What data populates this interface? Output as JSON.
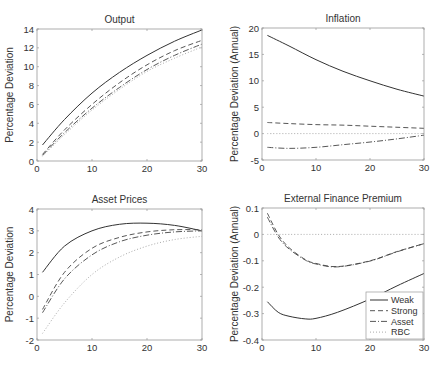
{
  "chart_data": [
    {
      "type": "line",
      "title": "Output",
      "xlabel": "",
      "ylabel": "Percentage Deviation",
      "xlim": [
        0,
        30
      ],
      "ylim": [
        0,
        14
      ],
      "xticks": [
        0,
        10,
        20,
        30
      ],
      "yticks": [
        0,
        2,
        4,
        6,
        8,
        10,
        12,
        14
      ],
      "grid": false,
      "x": [
        1,
        5,
        10,
        15,
        20,
        25,
        30
      ],
      "series": [
        {
          "name": "Weak",
          "style": "solid",
          "values": [
            1.7,
            4.4,
            7.2,
            9.4,
            11.2,
            12.7,
            13.9
          ]
        },
        {
          "name": "Strong",
          "style": "dashed",
          "values": [
            0.7,
            3.3,
            6.0,
            8.3,
            10.2,
            11.7,
            12.8
          ]
        },
        {
          "name": "Asset",
          "style": "dashdot",
          "values": [
            0.6,
            3.0,
            5.6,
            7.8,
            9.7,
            11.2,
            12.4
          ]
        },
        {
          "name": "RBC",
          "style": "dotted",
          "values": [
            0.5,
            2.8,
            5.4,
            7.6,
            9.5,
            10.9,
            12.1
          ]
        }
      ]
    },
    {
      "type": "line",
      "title": "Inflation",
      "xlabel": "",
      "ylabel": "Percentage Deviation (Annual)",
      "xlim": [
        0,
        30
      ],
      "ylim": [
        -5,
        20
      ],
      "xticks": [
        0,
        10,
        20,
        30
      ],
      "yticks": [
        -5,
        0,
        5,
        10,
        15,
        20
      ],
      "grid": false,
      "x": [
        1,
        5,
        10,
        15,
        20,
        25,
        30
      ],
      "series": [
        {
          "name": "Weak",
          "style": "solid",
          "values": [
            18.6,
            16.6,
            14.0,
            11.8,
            10.0,
            8.4,
            7.1
          ]
        },
        {
          "name": "Strong",
          "style": "dashed",
          "values": [
            2.1,
            1.9,
            1.7,
            1.6,
            1.4,
            1.2,
            1.0
          ]
        },
        {
          "name": "Asset",
          "style": "dashdot",
          "values": [
            -2.6,
            -2.8,
            -2.6,
            -2.1,
            -1.6,
            -1.0,
            -0.3
          ]
        },
        {
          "name": "RBC",
          "style": "dotted",
          "values": [
            0,
            0,
            0,
            0,
            0,
            0,
            0
          ]
        }
      ]
    },
    {
      "type": "line",
      "title": "Asset Prices",
      "xlabel": "",
      "ylabel": "Percentage Deviation",
      "xlim": [
        0,
        30
      ],
      "ylim": [
        -2,
        4
      ],
      "xticks": [
        0,
        10,
        20,
        30
      ],
      "yticks": [
        -2,
        -1,
        0,
        1,
        2,
        3,
        4
      ],
      "grid": false,
      "x": [
        1,
        5,
        10,
        15,
        20,
        25,
        30
      ],
      "series": [
        {
          "name": "Weak",
          "style": "solid",
          "values": [
            1.1,
            2.3,
            3.0,
            3.3,
            3.35,
            3.25,
            3.0
          ]
        },
        {
          "name": "Strong",
          "style": "dashed",
          "values": [
            -0.6,
            1.1,
            2.2,
            2.7,
            2.95,
            3.05,
            3.05
          ]
        },
        {
          "name": "Asset",
          "style": "dashdot",
          "values": [
            -0.75,
            0.8,
            1.9,
            2.5,
            2.8,
            2.95,
            3.0
          ]
        },
        {
          "name": "RBC",
          "style": "dotted",
          "values": [
            -1.7,
            -0.3,
            1.0,
            1.8,
            2.3,
            2.6,
            2.75
          ]
        }
      ]
    },
    {
      "type": "line",
      "title": "External Finance Premium",
      "xlabel": "",
      "ylabel": "Percentage Deviation (Annual)",
      "xlim": [
        0,
        30
      ],
      "ylim": [
        -0.4,
        0.1
      ],
      "xticks": [
        0,
        10,
        20,
        30
      ],
      "yticks": [
        -0.4,
        -0.3,
        -0.2,
        -0.1,
        0,
        0.1
      ],
      "grid": false,
      "legend_position": "lower right",
      "x": [
        1,
        3,
        5,
        8,
        10,
        14,
        20,
        25,
        30
      ],
      "series": [
        {
          "name": "Weak",
          "style": "solid",
          "values": [
            -0.255,
            -0.295,
            -0.31,
            -0.32,
            -0.318,
            -0.295,
            -0.245,
            -0.195,
            -0.148
          ]
        },
        {
          "name": "Strong",
          "style": "dashed",
          "values": [
            0.08,
            0.0,
            -0.05,
            -0.095,
            -0.11,
            -0.122,
            -0.1,
            -0.065,
            -0.035
          ]
        },
        {
          "name": "Asset",
          "style": "dashdot",
          "values": [
            0.065,
            -0.01,
            -0.055,
            -0.097,
            -0.112,
            -0.123,
            -0.101,
            -0.066,
            -0.035
          ]
        },
        {
          "name": "RBC",
          "style": "dotted",
          "values": [
            0,
            0,
            0,
            0,
            0,
            0,
            0,
            0,
            0
          ]
        }
      ]
    }
  ],
  "legend": {
    "items": [
      {
        "label": "Weak",
        "style": "solid"
      },
      {
        "label": "Strong",
        "style": "dashed"
      },
      {
        "label": "Asset",
        "style": "dashdot"
      },
      {
        "label": "RBC",
        "style": "dotted"
      }
    ]
  }
}
